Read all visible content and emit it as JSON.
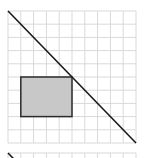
{
  "diagram": {
    "type": "grid-geometry",
    "colors": {
      "background": "#ffffff",
      "grid_line": "#d9d9d9",
      "diagonal_line": "#1a1a1a",
      "rect_fill": "#c8c8c8",
      "rect_stroke": "#2a2a2a"
    },
    "main_grid": {
      "x": 8,
      "y": 11,
      "width": 128,
      "height": 132,
      "columns": 10,
      "rows": 10
    },
    "diagonal": {
      "from": [
        8,
        11
      ],
      "to": [
        136,
        143
      ]
    },
    "rectangle": {
      "grid_col_start": 1,
      "grid_row_start": 5,
      "grid_cols": 4,
      "grid_rows": 3,
      "x": 21,
      "y": 77,
      "width": 52,
      "height": 40
    },
    "second_grid": {
      "x": 8,
      "y": 153,
      "width": 128,
      "height": 13,
      "columns": 10,
      "rows": 1,
      "diagonal_start": [
        8,
        153
      ]
    }
  }
}
